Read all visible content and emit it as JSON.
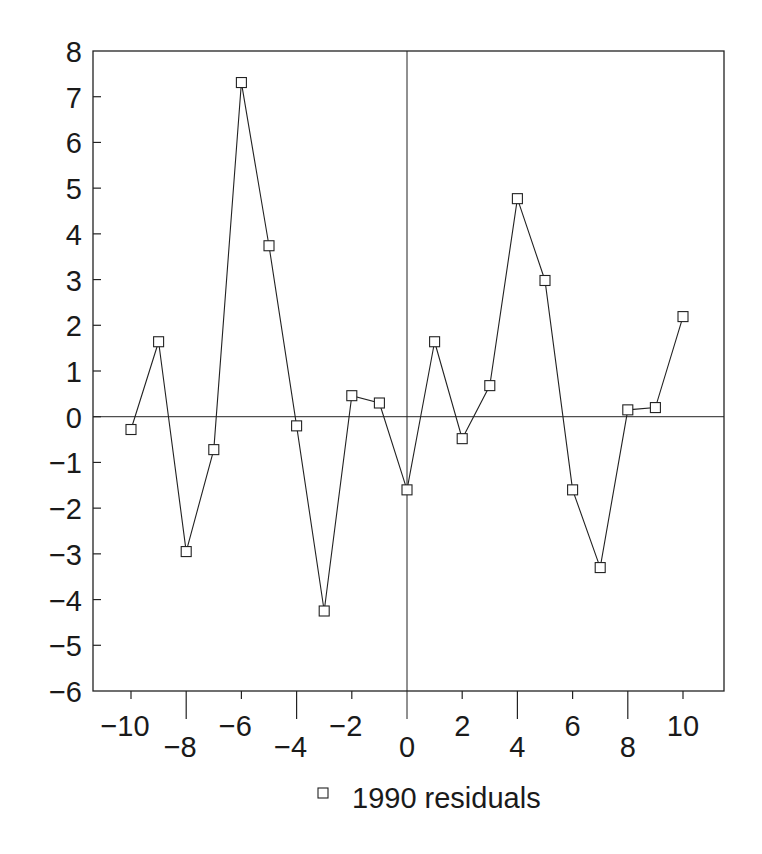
{
  "chart_data": {
    "type": "line",
    "title": "",
    "xlabel": "",
    "ylabel": "",
    "xlim": [
      -11.3,
      11.5
    ],
    "ylim": [
      -6,
      8
    ],
    "grid": false,
    "reference_lines": {
      "x": 0,
      "y": 0
    },
    "legend_position": "bottom",
    "x_ticks": [
      -10,
      -8,
      -6,
      -4,
      -2,
      0,
      2,
      4,
      6,
      8,
      10
    ],
    "x_tick_labels": [
      "−10",
      "−8",
      "−6",
      "−4",
      "−2",
      "0",
      "2",
      "4",
      "6",
      "8",
      "10"
    ],
    "y_ticks": [
      8,
      7,
      6,
      5,
      4,
      3,
      2,
      1,
      0,
      -1,
      -2,
      -3,
      -4,
      -5,
      -6
    ],
    "y_tick_labels": [
      "8",
      "7",
      "6",
      "5",
      "4",
      "3",
      "2",
      "1",
      "0",
      "−1",
      "−2",
      "−3",
      "−4",
      "−5",
      "−6"
    ],
    "x": [
      -10,
      -9,
      -8,
      -7,
      -6,
      -5,
      -4,
      -3,
      -2,
      -1,
      0,
      1,
      2,
      3,
      4,
      5,
      6,
      7,
      8,
      9,
      10
    ],
    "series": [
      {
        "name": "1990 residuals",
        "marker": "square",
        "values": [
          -0.28,
          1.64,
          -2.95,
          -0.72,
          7.31,
          3.74,
          -0.2,
          -4.25,
          0.46,
          0.3,
          -1.6,
          1.64,
          -0.48,
          0.68,
          4.77,
          2.98,
          -1.6,
          -3.3,
          0.15,
          0.2,
          2.19
        ]
      }
    ]
  },
  "legend": {
    "items": [
      {
        "label": "1990 residuals",
        "marker": "square"
      }
    ]
  },
  "colors": {
    "ink": "#222222",
    "background": "#ffffff"
  }
}
